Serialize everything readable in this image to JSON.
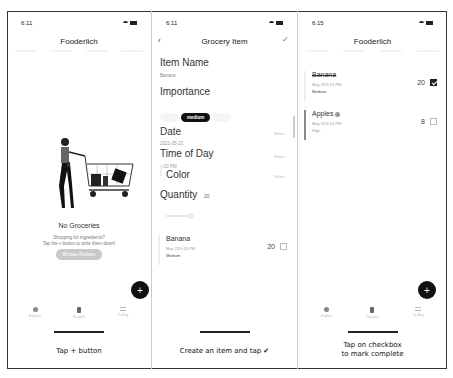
{
  "panels": [
    {
      "status": {
        "time": "6:11"
      },
      "title": "Fooderlich",
      "empty_state": {
        "title": "No Groceries",
        "subtitle_line1": "Shopping for ingredients?",
        "subtitle_line2": "Tap the + button to write them down!",
        "button_label": "Browse Recipes"
      },
      "fab_label": "+",
      "tabs": [
        {
          "label": "Explore",
          "icon": "compass-icon"
        },
        {
          "label": "Recipes",
          "icon": "book-icon"
        },
        {
          "label": "To Buy",
          "icon": "list-icon"
        }
      ],
      "caption": "Tap + button"
    },
    {
      "status": {
        "time": "6:11"
      },
      "title": "Grocery Item",
      "back_icon": "‹",
      "save_icon": "✓",
      "form": {
        "item_name_label": "Item Name",
        "item_name_value": "Banana",
        "importance_label": "Importance",
        "importance_options": [
          "low",
          "medium",
          "high"
        ],
        "importance_selected": "medium",
        "date_label": "Date",
        "date_value": "2021-05-23",
        "date_action": "Select",
        "time_label": "Time of Day",
        "time_value": "6:10 PM",
        "time_action": "Select",
        "color_label": "Color",
        "color_action": "Select",
        "quantity_label": "Quantity",
        "quantity_value": "20"
      },
      "preview": {
        "name": "Banana",
        "date": "May 23 6:10 PM",
        "importance": "Medium",
        "quantity": "20",
        "checked": false
      },
      "caption": "Create an item and tap ✔"
    },
    {
      "status": {
        "time": "6:15"
      },
      "title": "Fooderlich",
      "items": [
        {
          "name": "Banana",
          "date": "May 23 6:14 PM",
          "importance": "Medium",
          "quantity": "20",
          "checked": true
        },
        {
          "name": "Apples",
          "date": "May 23 6:14 PM",
          "importance": "High",
          "quantity": "8",
          "checked": false
        }
      ],
      "fab_label": "+",
      "tabs": [
        {
          "label": "Explore",
          "icon": "compass-icon"
        },
        {
          "label": "Recipes",
          "icon": "book-icon"
        },
        {
          "label": "To Buy",
          "icon": "list-icon"
        }
      ],
      "caption_line1": "Tap on checkbox",
      "caption_line2": "to mark complete"
    }
  ]
}
